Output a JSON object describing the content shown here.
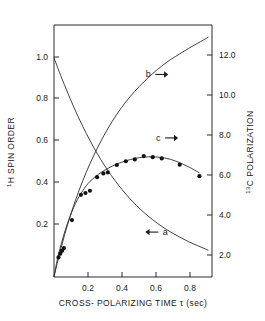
{
  "chart_data": {
    "type": "line",
    "title": "",
    "xlabel": "CROSS- POLARIZING  TIME τ (sec)",
    "ylabel_left": "¹H SPIN ORDER",
    "ylabel_right": "¹³C POLARIZATION",
    "ylabel_left_sup": "1",
    "ylabel_left_main": "H SPIN ORDER",
    "ylabel_right_sup": "13",
    "ylabel_right_main": "C POLARIZATION",
    "xlabel_tau": "τ",
    "xlim": [
      0.0,
      0.88
    ],
    "ylim_left": [
      0.0,
      1.15
    ],
    "ylim_right": [
      0.0,
      13.5
    ],
    "grid": false,
    "legend_position": "inline-annotations",
    "xticks": [
      0.2,
      0.4,
      0.6,
      0.8
    ],
    "xtick_labels": [
      "0.2",
      "0.4",
      "0.6",
      "0.8"
    ],
    "yticks_left": [
      0.2,
      0.4,
      0.6,
      0.8,
      1.0
    ],
    "ytick_labels_left": [
      "0.2",
      "0.4",
      "0.6",
      "0.8",
      "1.0"
    ],
    "yticks_right": [
      2.0,
      4.0,
      6.0,
      8.0,
      10.0,
      12.0
    ],
    "ytick_labels_right": [
      "2.0",
      "4.0",
      "6.0",
      "8.0",
      "10.0",
      "12.0"
    ],
    "series": [
      {
        "name": "a",
        "label": "a",
        "axis": "left",
        "arrow": "left",
        "style": "line",
        "annotation_x": 0.62,
        "annotation_y": 0.205,
        "x": [
          0.0,
          0.03,
          0.06,
          0.1,
          0.14,
          0.18,
          0.22,
          0.26,
          0.3,
          0.34,
          0.38,
          0.42,
          0.46,
          0.5,
          0.55,
          0.6,
          0.65,
          0.7,
          0.75,
          0.8,
          0.86
        ],
        "y": [
          1.0,
          0.935,
          0.873,
          0.795,
          0.722,
          0.655,
          0.593,
          0.537,
          0.486,
          0.44,
          0.398,
          0.36,
          0.326,
          0.295,
          0.261,
          0.231,
          0.205,
          0.182,
          0.161,
          0.143,
          0.122
        ]
      },
      {
        "name": "b",
        "label": "b",
        "axis": "right",
        "arrow": "right",
        "style": "line",
        "annotation_x": 0.525,
        "annotation_y_right": 10.85,
        "x": [
          0.0,
          0.02,
          0.04,
          0.07,
          0.1,
          0.14,
          0.18,
          0.22,
          0.26,
          0.3,
          0.35,
          0.4,
          0.45,
          0.5,
          0.55,
          0.6,
          0.65,
          0.7,
          0.75,
          0.8,
          0.86
        ],
        "y_right": [
          0.0,
          0.82,
          1.58,
          2.62,
          3.55,
          4.65,
          5.62,
          6.48,
          7.25,
          7.95,
          8.72,
          9.38,
          9.95,
          10.45,
          10.9,
          11.3,
          11.65,
          11.95,
          12.25,
          12.52,
          12.85
        ]
      },
      {
        "name": "c",
        "label": "c",
        "axis": "right",
        "arrow": "right",
        "style": "line-with-markers",
        "annotation_x": 0.58,
        "annotation_y_right": 7.45,
        "x": [
          0.0,
          0.02,
          0.05,
          0.08,
          0.12,
          0.16,
          0.2,
          0.25,
          0.3,
          0.35,
          0.4,
          0.45,
          0.5,
          0.55,
          0.6,
          0.65,
          0.7,
          0.75,
          0.81
        ],
        "y_right": [
          0.0,
          1.0,
          2.1,
          3.0,
          3.95,
          4.62,
          5.12,
          5.52,
          5.82,
          6.05,
          6.22,
          6.35,
          6.42,
          6.44,
          6.4,
          6.3,
          6.12,
          5.9,
          5.58
        ],
        "points_x": [
          0.025,
          0.035,
          0.045,
          0.055,
          0.1,
          0.15,
          0.175,
          0.2,
          0.24,
          0.275,
          0.3,
          0.35,
          0.4,
          0.45,
          0.5,
          0.55,
          0.6,
          0.7,
          0.81
        ],
        "points_y_right": [
          1.05,
          1.25,
          1.4,
          1.55,
          3.05,
          4.4,
          4.5,
          4.62,
          5.35,
          5.55,
          5.6,
          6.0,
          6.2,
          6.3,
          6.48,
          6.42,
          6.35,
          6.02,
          5.4
        ]
      }
    ]
  }
}
